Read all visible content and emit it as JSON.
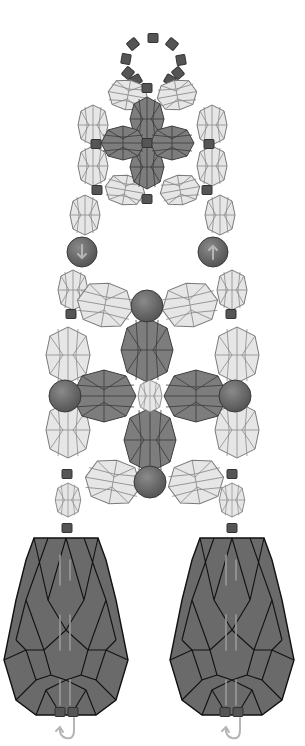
{
  "diagram": {
    "colors": {
      "background": "#ffffff",
      "seed_bead": "#555555",
      "round_bead": "#666666",
      "bicone_light": "#e6e6e6",
      "bicone_dark": "#7d7d7d",
      "drop_bead": "#6a6a6a",
      "thread_path": "#b5b5b5"
    },
    "components": {
      "top_loop": "ring of seed beads",
      "upper_cluster": "dark bicone cross with light bicone surround",
      "side_round_beads": 2,
      "central_cluster": "dark bicone cross around small light bicone, 4 round beads",
      "teardrop_beads": 2
    }
  }
}
